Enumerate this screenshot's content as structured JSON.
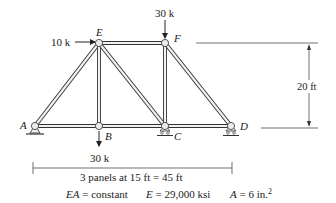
{
  "diagram": {
    "type": "truss",
    "joints": [
      {
        "id": "A",
        "label": "A",
        "x": 35,
        "y": 126,
        "support": "pin"
      },
      {
        "id": "B",
        "label": "B",
        "x": 99,
        "y": 126,
        "support": "none"
      },
      {
        "id": "C",
        "label": "C",
        "x": 165,
        "y": 126,
        "support": "roller"
      },
      {
        "id": "D",
        "label": "D",
        "x": 231,
        "y": 126,
        "support": "roller"
      },
      {
        "id": "E",
        "label": "E",
        "x": 99,
        "y": 43,
        "support": "none"
      },
      {
        "id": "F",
        "label": "F",
        "x": 165,
        "y": 43,
        "support": "none"
      }
    ],
    "members": [
      [
        "A",
        "B"
      ],
      [
        "B",
        "C"
      ],
      [
        "C",
        "D"
      ],
      [
        "E",
        "F"
      ],
      [
        "A",
        "E"
      ],
      [
        "B",
        "E"
      ],
      [
        "E",
        "C"
      ],
      [
        "F",
        "C"
      ],
      [
        "F",
        "D"
      ]
    ],
    "loads": [
      {
        "joint": "E",
        "label": "10 k",
        "direction": "right"
      },
      {
        "joint": "F",
        "label": "30 k",
        "direction": "down"
      },
      {
        "joint": "B",
        "label": "30 k",
        "direction": "down"
      }
    ],
    "dimensions": {
      "height_label": "20 ft",
      "span_label": "3 panels at 15 ft = 45 ft"
    },
    "properties": {
      "ea": "EA = constant",
      "e": "E = 29,000 ksi",
      "a": "A = 6 in.",
      "a_sup": "2"
    }
  },
  "colors": {
    "line": "#333333",
    "member_fill": "#f2f2f2"
  }
}
